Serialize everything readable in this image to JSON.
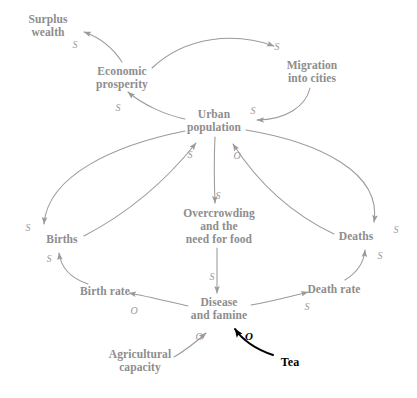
{
  "diagram": {
    "colors": {
      "node_text": "#8d8d8d",
      "arrow": "#9a9a9a",
      "polarity_text": "#9a9a9a",
      "annotation": "#000000",
      "background": "#ffffff"
    },
    "nodes": [
      {
        "id": "surplus_wealth",
        "lines": [
          "Surplus",
          "wealth"
        ],
        "x": 48,
        "y": 26
      },
      {
        "id": "economic_prosperity",
        "lines": [
          "Economic",
          "prosperity"
        ],
        "x": 122,
        "y": 78
      },
      {
        "id": "migration",
        "lines": [
          "Migration",
          "into cities"
        ],
        "x": 312,
        "y": 72
      },
      {
        "id": "urban_population",
        "lines": [
          "Urban",
          "population"
        ],
        "x": 214,
        "y": 121
      },
      {
        "id": "births",
        "lines": [
          "Births"
        ],
        "x": 62,
        "y": 239
      },
      {
        "id": "overcrowding",
        "lines": [
          "Overcrowding",
          "and the",
          "need for food"
        ],
        "x": 219,
        "y": 226
      },
      {
        "id": "deaths",
        "lines": [
          "Deaths"
        ],
        "x": 356,
        "y": 236
      },
      {
        "id": "birth_rate",
        "lines": [
          "Birth rate"
        ],
        "x": 105,
        "y": 291
      },
      {
        "id": "death_rate",
        "lines": [
          "Death rate"
        ],
        "x": 334,
        "y": 289
      },
      {
        "id": "disease_famine",
        "lines": [
          "Disease",
          "and famine"
        ],
        "x": 219,
        "y": 309
      },
      {
        "id": "agricultural",
        "lines": [
          "Agricultural",
          "capacity"
        ],
        "x": 140,
        "y": 361
      }
    ],
    "annotations": [
      {
        "id": "tea",
        "label": "Tea",
        "x": 290,
        "y": 362
      }
    ],
    "edges": [
      {
        "id": "economic-to-surplus",
        "from": "economic_prosperity",
        "to": "surplus_wealth",
        "polarity": "S"
      },
      {
        "id": "economic-to-migration",
        "from": "economic_prosperity",
        "to": "migration",
        "polarity": "S"
      },
      {
        "id": "migration-to-urban",
        "from": "migration",
        "to": "urban_population",
        "polarity": "S"
      },
      {
        "id": "urban-to-economic",
        "from": "urban_population",
        "to": "economic_prosperity",
        "polarity": "S"
      },
      {
        "id": "births-to-urban",
        "from": "births",
        "to": "urban_population",
        "polarity": "S"
      },
      {
        "id": "deaths-to-urban",
        "from": "deaths",
        "to": "urban_population",
        "polarity": "O"
      },
      {
        "id": "urban-to-births",
        "from": "urban_population",
        "to": "births",
        "polarity": "S"
      },
      {
        "id": "urban-to-overcrowding",
        "from": "urban_population",
        "to": "overcrowding",
        "polarity": "S"
      },
      {
        "id": "urban-to-deaths",
        "from": "urban_population",
        "to": "deaths",
        "polarity": "S"
      },
      {
        "id": "birthrate-to-births",
        "from": "birth_rate",
        "to": "births",
        "polarity": "S"
      },
      {
        "id": "overcrowding-to-disease",
        "from": "overcrowding",
        "to": "disease_famine",
        "polarity": "S"
      },
      {
        "id": "disease-to-birthrate",
        "from": "disease_famine",
        "to": "birth_rate",
        "polarity": "O"
      },
      {
        "id": "disease-to-deathrate",
        "from": "disease_famine",
        "to": "death_rate",
        "polarity": "S"
      },
      {
        "id": "deathrate-to-deaths",
        "from": "death_rate",
        "to": "deaths",
        "polarity": "S"
      },
      {
        "id": "agricultural-to-disease",
        "from": "agricultural",
        "to": "disease_famine",
        "polarity": "O"
      },
      {
        "id": "tea-to-disease",
        "from": "tea",
        "to": "disease_famine",
        "polarity": "O",
        "emphasis": "bold-black"
      }
    ],
    "polarity_labels": [
      {
        "id": "pol-economic-surplus",
        "text": "S",
        "x": 75,
        "y": 45
      },
      {
        "id": "pol-economic-migration",
        "text": "S",
        "x": 277,
        "y": 47
      },
      {
        "id": "pol-migration-urban",
        "text": "S",
        "x": 253,
        "y": 111
      },
      {
        "id": "pol-urban-economic",
        "text": "S",
        "x": 118,
        "y": 108
      },
      {
        "id": "pol-births-urban",
        "text": "S",
        "x": 190,
        "y": 155
      },
      {
        "id": "pol-deaths-urban",
        "text": "O",
        "x": 237,
        "y": 156
      },
      {
        "id": "pol-urban-overcrowding",
        "text": "S",
        "x": 218,
        "y": 196
      },
      {
        "id": "pol-urban-births",
        "text": "S",
        "x": 28,
        "y": 228
      },
      {
        "id": "pol-urban-deaths",
        "text": "S",
        "x": 396,
        "y": 230
      },
      {
        "id": "pol-birthrate-births",
        "text": "S",
        "x": 49,
        "y": 259
      },
      {
        "id": "pol-deathrate-deaths",
        "text": "S",
        "x": 380,
        "y": 256
      },
      {
        "id": "pol-overcrowding-disease",
        "text": "S",
        "x": 212,
        "y": 277
      },
      {
        "id": "pol-disease-birthrate",
        "text": "O",
        "x": 134,
        "y": 311
      },
      {
        "id": "pol-disease-deathrate",
        "text": "S",
        "x": 307,
        "y": 307
      },
      {
        "id": "pol-agricultural-disease",
        "text": "O",
        "x": 199,
        "y": 337
      },
      {
        "id": "pol-tea-disease",
        "text": "O",
        "x": 249,
        "y": 336,
        "emphasis": "bold-black"
      }
    ]
  }
}
